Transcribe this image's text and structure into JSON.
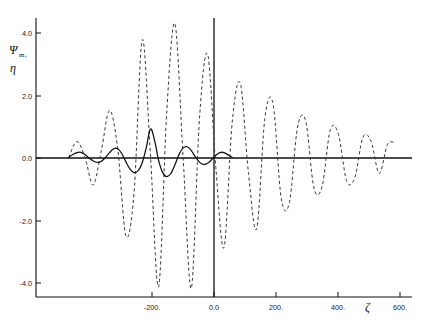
{
  "figure": {
    "background_color": "#ffffff",
    "foreground_color": "#101010"
  },
  "axis_titles": {
    "y_main": "Ψ",
    "y_sub": "m",
    "y_comma": ",",
    "y_second": "η",
    "x_label": "ζ"
  },
  "ticks": {
    "x_labels": [
      "-200.",
      "0.0",
      "200.",
      "400.",
      "600."
    ],
    "x_values": [
      -200,
      0,
      200,
      400,
      600
    ],
    "y_labels": [
      "4.0",
      "2.0",
      "0.0",
      "-2.0",
      "-4.0"
    ],
    "y_values": [
      4.0,
      2.0,
      0.0,
      -2.0,
      -4.0
    ]
  },
  "chart_data": {
    "type": "line",
    "title": "",
    "subtitle": "",
    "xlabel": "ζ",
    "ylabel": "Ψm, η",
    "xlim": [
      -280,
      640
    ],
    "ylim": [
      -4.8,
      4.8
    ],
    "grid": false,
    "legend": "none",
    "x_tick_labels": [
      "-200.",
      "0.0",
      "200.",
      "400.",
      "600."
    ],
    "y_tick_labels": [
      "4.0",
      "2.0",
      "0.0",
      "-2.0",
      "-4.0"
    ],
    "annotations": [],
    "series": [
      {
        "name": "Ψm",
        "style": "solid",
        "color": "#101010",
        "description": "Localized damped oscillation, peak amplitude ~1.0 at zeta = 0, decaying to near zero by zeta = +/-200.",
        "x": [
          -200,
          -190,
          -180,
          -170,
          -160,
          -150,
          -140,
          -130,
          -120,
          -110,
          -100,
          -90,
          -80,
          -70,
          -60,
          -50,
          -40,
          -30,
          -20,
          -10,
          0,
          10,
          20,
          30,
          40,
          50,
          60,
          70,
          80,
          90,
          100,
          110,
          120,
          130,
          140,
          150,
          160,
          170,
          180,
          190,
          200
        ],
        "y": [
          0.0,
          0.1,
          0.17,
          0.18,
          0.1,
          -0.02,
          -0.12,
          -0.17,
          -0.13,
          0.0,
          0.17,
          0.3,
          0.3,
          0.13,
          -0.15,
          -0.4,
          -0.52,
          -0.45,
          -0.18,
          0.35,
          0.98,
          0.6,
          -0.1,
          -0.52,
          -0.66,
          -0.55,
          -0.25,
          0.1,
          0.33,
          0.37,
          0.24,
          0.02,
          -0.16,
          -0.24,
          -0.2,
          -0.07,
          0.08,
          0.17,
          0.17,
          0.09,
          0.0
        ]
      },
      {
        "name": "η",
        "style": "dashed",
        "color": "#3a3a3a",
        "description": "Large-amplitude oscillation growing to maximum ~4.6 near zeta = 60, then slowly decaying to ~0.5 at zeta = 600.",
        "x": [
          -200,
          -180,
          -160,
          -140,
          -120,
          -100,
          -80,
          -60,
          -40,
          -20,
          0,
          20,
          40,
          60,
          80,
          100,
          120,
          140,
          160,
          180,
          200,
          220,
          240,
          260,
          280,
          300,
          320,
          340,
          360,
          380,
          400,
          420,
          440,
          460,
          480,
          500,
          520,
          540,
          560,
          580,
          600
        ],
        "y": [
          0.0,
          0.55,
          0.0,
          -0.95,
          0.25,
          1.62,
          0.3,
          -2.7,
          -1.2,
          4.05,
          0.1,
          -4.45,
          1.6,
          4.6,
          0.0,
          -4.5,
          1.35,
          3.55,
          -0.35,
          -3.1,
          1.2,
          2.55,
          -0.55,
          -2.45,
          1.35,
          1.85,
          -1.4,
          -1.55,
          1.05,
          1.25,
          -1.05,
          -1.0,
          0.95,
          0.8,
          -0.8,
          -0.7,
          0.7,
          0.55,
          -0.55,
          0.45,
          0.5
        ]
      }
    ]
  }
}
